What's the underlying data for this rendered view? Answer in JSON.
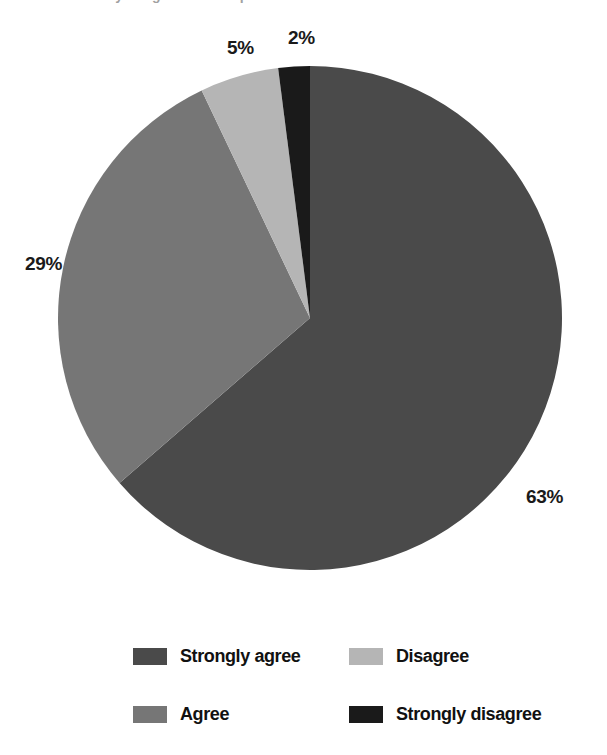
{
  "heading": {
    "clipped_text": "survey of agreement responses"
  },
  "chart_data": {
    "type": "pie",
    "title": "",
    "start_angle_deg": 0,
    "direction": "clockwise",
    "legend_position": "bottom",
    "grid": false,
    "categories": [
      "Strongly agree",
      "Agree",
      "Disagree",
      "Strongly disagree"
    ],
    "values": [
      63,
      29,
      5,
      2
    ],
    "unit": "%",
    "colors": [
      "#4a4a4a",
      "#767676",
      "#b5b5b5",
      "#1a1a1a"
    ],
    "data_labels": [
      "63%",
      "29%",
      "5%",
      "2%"
    ]
  },
  "pie_labels": {
    "strongly_agree": "63%",
    "agree": "29%",
    "disagree": "5%",
    "strongly_disagree": "2%"
  },
  "legend": {
    "items": [
      {
        "label": "Strongly agree",
        "color": "#4a4a4a"
      },
      {
        "label": "Disagree",
        "color": "#b5b5b5"
      },
      {
        "label": "Agree",
        "color": "#767676"
      },
      {
        "label": "Strongly disagree",
        "color": "#1a1a1a"
      }
    ]
  }
}
